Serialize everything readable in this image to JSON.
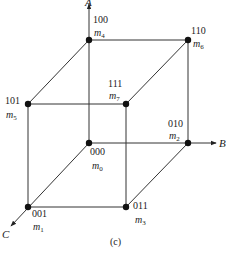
{
  "diagram": {
    "type": "boolean-3-cube",
    "caption": "(c)",
    "caption_letter": "c",
    "line_color": "#333333",
    "node_color": "#111111",
    "axes": [
      {
        "id": "A",
        "label": "A",
        "direction": "up"
      },
      {
        "id": "B",
        "label": "B",
        "direction": "right"
      },
      {
        "id": "C",
        "label": "C",
        "direction": "down-left"
      }
    ],
    "vertices": [
      {
        "code": "000",
        "minterm": "m",
        "index": "0"
      },
      {
        "code": "001",
        "minterm": "m",
        "index": "1"
      },
      {
        "code": "010",
        "minterm": "m",
        "index": "2"
      },
      {
        "code": "011",
        "minterm": "m",
        "index": "3"
      },
      {
        "code": "100",
        "minterm": "m",
        "index": "4"
      },
      {
        "code": "101",
        "minterm": "m",
        "index": "5"
      },
      {
        "code": "110",
        "minterm": "m",
        "index": "6"
      },
      {
        "code": "111",
        "minterm": "m",
        "index": "7"
      }
    ],
    "edges": [
      [
        "000",
        "001"
      ],
      [
        "000",
        "010"
      ],
      [
        "000",
        "100"
      ],
      [
        "001",
        "011"
      ],
      [
        "001",
        "101"
      ],
      [
        "010",
        "011"
      ],
      [
        "010",
        "110"
      ],
      [
        "011",
        "111"
      ],
      [
        "100",
        "101"
      ],
      [
        "100",
        "110"
      ],
      [
        "101",
        "111"
      ],
      [
        "110",
        "111"
      ]
    ]
  }
}
